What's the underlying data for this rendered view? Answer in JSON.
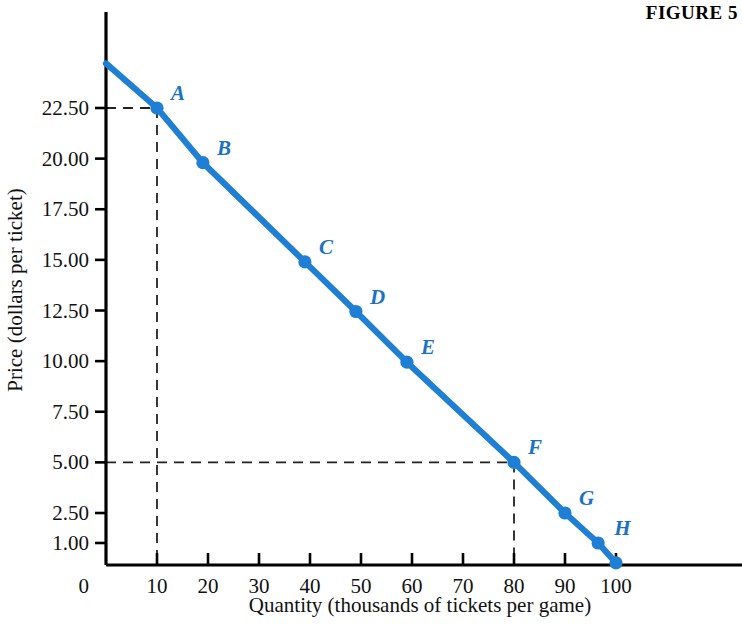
{
  "figure": {
    "title": "FIGURE 5"
  },
  "chart_data": {
    "type": "line",
    "title": "FIGURE 5",
    "xlabel": "Quantity (thousands of tickets per game)",
    "ylabel": "Price (dollars per ticket)",
    "xlim": [
      0,
      104
    ],
    "ylim": [
      0,
      26
    ],
    "grid": false,
    "legend": "none",
    "line_color": "#1f7fd4",
    "point_color": "#1f7fd4",
    "guide_color": "#222222",
    "x_ticks": [
      "0",
      "10",
      "20",
      "30",
      "40",
      "50",
      "60",
      "70",
      "80",
      "90",
      "100"
    ],
    "x_tick_values": [
      0,
      10,
      20,
      30,
      40,
      50,
      60,
      70,
      80,
      90,
      100
    ],
    "y_ticks": [
      "1.00",
      "2.50",
      "5.00",
      "7.50",
      "10.00",
      "12.50",
      "15.00",
      "17.50",
      "20.00",
      "22.50"
    ],
    "y_tick_values": [
      1.0,
      2.5,
      5.0,
      7.5,
      10.0,
      12.5,
      15.0,
      17.5,
      20.0,
      22.5
    ],
    "y_origin_label": "0",
    "series": [
      {
        "name": "Demand",
        "x": [
          0,
          10,
          19,
          39,
          49,
          59,
          80,
          90,
          96.5,
          100
        ],
        "y": [
          24.7,
          22.5,
          19.8,
          14.9,
          12.45,
          9.95,
          5.0,
          2.5,
          1.0,
          0.1
        ]
      }
    ],
    "points": [
      {
        "label": "A",
        "x": 10,
        "y": 22.5,
        "label_dx": 14,
        "label_dy": -8
      },
      {
        "label": "B",
        "x": 19,
        "y": 19.8,
        "label_dx": 14,
        "label_dy": -8
      },
      {
        "label": "C",
        "x": 39,
        "y": 14.9,
        "label_dx": 14,
        "label_dy": -8
      },
      {
        "label": "D",
        "x": 49,
        "y": 12.45,
        "label_dx": 14,
        "label_dy": -8
      },
      {
        "label": "E",
        "x": 59,
        "y": 9.95,
        "label_dx": 14,
        "label_dy": -8
      },
      {
        "label": "F",
        "x": 80,
        "y": 5.0,
        "label_dx": 14,
        "label_dy": -8
      },
      {
        "label": "G",
        "x": 90,
        "y": 2.5,
        "label_dx": 14,
        "label_dy": -8
      },
      {
        "label": "H",
        "x": 96.5,
        "y": 1.0,
        "label_dx": 16,
        "label_dy": -8
      },
      {
        "label": "",
        "x": 100,
        "y": 0.1,
        "label_dx": 0,
        "label_dy": 0
      }
    ],
    "annotations": [
      {
        "kind": "dashed-guide",
        "from_axis": "y",
        "value": 22.5,
        "to_x": 10,
        "note": "horizontal dashed guide at price 22.50 to point A"
      },
      {
        "kind": "dashed-guide",
        "from_axis": "x",
        "value": 10,
        "to_y": 22.5,
        "note": "vertical dashed guide at quantity 10 to point A"
      },
      {
        "kind": "dashed-guide",
        "from_axis": "y",
        "value": 5.0,
        "to_x": 80,
        "note": "horizontal dashed guide at price 5.00 to point F"
      },
      {
        "kind": "dashed-guide",
        "from_axis": "x",
        "value": 80,
        "to_y": 5.0,
        "note": "vertical dashed guide at quantity 80 to point F"
      }
    ]
  }
}
